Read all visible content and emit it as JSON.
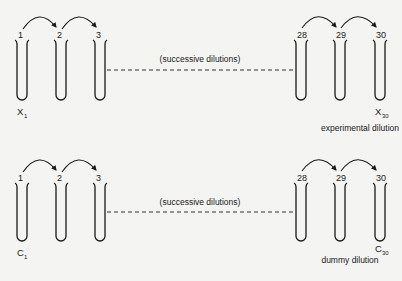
{
  "diagram": {
    "rows": [
      {
        "id": "experimental",
        "caption": "experimental dilution",
        "middle_note": "(successive dilutions)",
        "tubes": [
          {
            "number": "1",
            "x": 21
          },
          {
            "number": "2",
            "x": 60
          },
          {
            "number": "3",
            "x": 99
          },
          {
            "number": "28",
            "x": 302
          },
          {
            "number": "29",
            "x": 341
          },
          {
            "number": "30",
            "x": 381
          }
        ],
        "first_label": {
          "letter": "X",
          "sub": "1"
        },
        "last_label": {
          "letter": "X",
          "sub": "30"
        }
      },
      {
        "id": "dummy",
        "caption": "dummy dilution",
        "middle_note": "(successive dilutions)",
        "tubes": [
          {
            "number": "1",
            "x": 21
          },
          {
            "number": "2",
            "x": 60
          },
          {
            "number": "3",
            "x": 99
          },
          {
            "number": "28",
            "x": 302
          },
          {
            "number": "29",
            "x": 341
          },
          {
            "number": "30",
            "x": 381
          }
        ],
        "first_label": {
          "letter": "C",
          "sub": "1"
        },
        "last_label": {
          "letter": "C",
          "sub": "30"
        }
      }
    ],
    "colors": {
      "background": "#f4f4f2",
      "ink": "#1a1a1a"
    }
  }
}
